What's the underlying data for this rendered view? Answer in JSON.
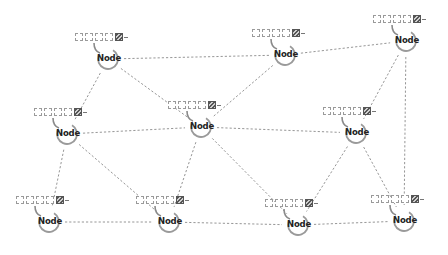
{
  "diagram": {
    "type": "network-topology",
    "node_label": "Node",
    "queue_slots": 5,
    "colors": {
      "edge": "#8a8a8a",
      "ring": "#9a9a9a",
      "text": "#222222",
      "filled_slot": "#555555"
    },
    "nodes": [
      {
        "id": "n1",
        "label": "Node",
        "x": 75,
        "y": 33
      },
      {
        "id": "n2",
        "label": "Node",
        "x": 252,
        "y": 29
      },
      {
        "id": "n3",
        "label": "Node",
        "x": 373,
        "y": 15
      },
      {
        "id": "n4",
        "label": "Node",
        "x": 34,
        "y": 108
      },
      {
        "id": "n5",
        "label": "Node",
        "x": 168,
        "y": 101
      },
      {
        "id": "n6",
        "label": "Node",
        "x": 323,
        "y": 107
      },
      {
        "id": "n7",
        "label": "Node",
        "x": 16,
        "y": 196
      },
      {
        "id": "n8",
        "label": "Node",
        "x": 136,
        "y": 196
      },
      {
        "id": "n9",
        "label": "Node",
        "x": 265,
        "y": 199
      },
      {
        "id": "n10",
        "label": "Node",
        "x": 371,
        "y": 195
      }
    ],
    "edges": [
      [
        "n1",
        "n2"
      ],
      [
        "n1",
        "n5"
      ],
      [
        "n1",
        "n4"
      ],
      [
        "n2",
        "n3"
      ],
      [
        "n2",
        "n5"
      ],
      [
        "n3",
        "n6"
      ],
      [
        "n3",
        "n10"
      ],
      [
        "n4",
        "n5"
      ],
      [
        "n4",
        "n7"
      ],
      [
        "n4",
        "n8"
      ],
      [
        "n5",
        "n6"
      ],
      [
        "n5",
        "n8"
      ],
      [
        "n5",
        "n9"
      ],
      [
        "n6",
        "n9"
      ],
      [
        "n6",
        "n10"
      ],
      [
        "n7",
        "n8"
      ],
      [
        "n8",
        "n9"
      ],
      [
        "n9",
        "n10"
      ]
    ]
  }
}
